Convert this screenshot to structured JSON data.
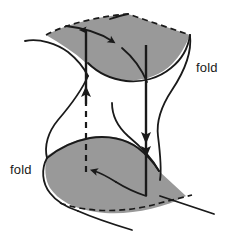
{
  "figure": {
    "type": "diagram",
    "background_color": "#ffffff",
    "stroke_color": "#1a1a1a",
    "sheet_fill_color": "#999999",
    "width": 237,
    "height": 246
  },
  "labels": {
    "fold_upper_right": "fold",
    "fold_lower_left": "fold"
  },
  "surfaces": [
    {
      "name": "upper-sheet",
      "fill": "#999999",
      "back_edge_style": "dashed",
      "front_edge_style": "solid"
    },
    {
      "name": "lower-sheet",
      "fill": "#999999",
      "back_edge_style": "solid",
      "front_edge_style": "dashed"
    }
  ],
  "jump_arrows": [
    {
      "name": "left-jump-arrow",
      "direction": "up",
      "line_style_lower": "dashed",
      "line_style_upper": "solid",
      "arrowheads": 2
    },
    {
      "name": "right-jump-arrow",
      "direction": "down",
      "line_style_lower": "solid",
      "line_style_upper": "solid",
      "arrowheads": 2
    }
  ],
  "path_arrows": [
    {
      "name": "upper-sheet-path-arrow",
      "direction": "right",
      "sheet": "upper"
    },
    {
      "name": "lower-sheet-path-arrow",
      "direction": "left",
      "sheet": "lower"
    }
  ]
}
